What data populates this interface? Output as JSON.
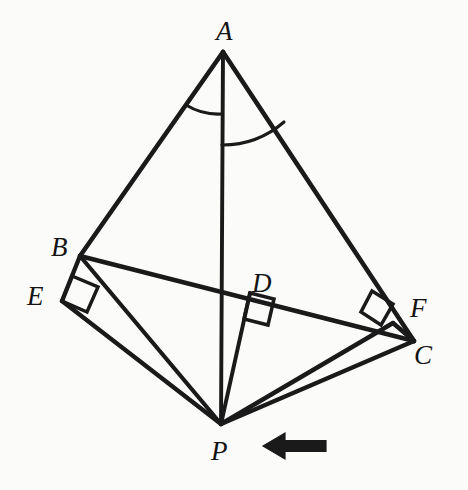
{
  "figure": {
    "background_color": "#fbfbf9",
    "stroke_color": "#1a1a1a",
    "label_color": "#131313",
    "canvas": {
      "width": 468,
      "height": 490
    },
    "points": [
      {
        "id": "A",
        "label": "A",
        "x": 223,
        "y": 52,
        "label_x": 225,
        "label_y": 31
      },
      {
        "id": "B",
        "label": "B",
        "x": 80,
        "y": 256,
        "label_x": 61,
        "label_y": 248
      },
      {
        "id": "C",
        "label": "C",
        "x": 414,
        "y": 341,
        "label_x": 424,
        "label_y": 356
      },
      {
        "id": "D",
        "label": "D",
        "x": 250,
        "y": 293,
        "label_x": 262,
        "label_y": 284
      },
      {
        "id": "E",
        "label": "E",
        "x": 62,
        "y": 301,
        "label_x": 37,
        "label_y": 297
      },
      {
        "id": "F",
        "label": "F",
        "x": 393,
        "y": 323,
        "label_x": 419,
        "label_y": 309
      },
      {
        "id": "P",
        "label": "P",
        "x": 221,
        "y": 424,
        "label_x": 219,
        "label_y": 452
      }
    ],
    "segments": [
      {
        "name": "side-AB",
        "from": "A",
        "to": "B"
      },
      {
        "name": "side-AC",
        "from": "A",
        "to": "C"
      },
      {
        "name": "side-BC",
        "from": "B",
        "to": "C"
      },
      {
        "name": "cevian-AP",
        "from": "A",
        "to": "P"
      },
      {
        "name": "segment-BE",
        "from": "B",
        "to": "E"
      },
      {
        "name": "segment-CF",
        "from": "C",
        "to": "F"
      },
      {
        "name": "perpendicular-PE",
        "from": "P",
        "to": "E"
      },
      {
        "name": "perpendicular-PF",
        "from": "P",
        "to": "F"
      },
      {
        "name": "perpendicular-PD",
        "from": "P",
        "to": "D"
      },
      {
        "name": "segment-PB",
        "from": "P",
        "to": "B"
      },
      {
        "name": "segment-PC",
        "from": "P",
        "to": "C"
      }
    ],
    "right_angle_marks": [
      {
        "name": "right-angle-at-E",
        "vertex": "E",
        "size": 26
      },
      {
        "name": "right-angle-at-F",
        "vertex": "F",
        "size": 24
      },
      {
        "name": "right-angle-at-D",
        "vertex": "D",
        "size": 25
      }
    ],
    "angle_arcs": [
      {
        "name": "angle-arc-BAP",
        "vertex": "A",
        "radius": 52,
        "note": "arc between AB and AP"
      },
      {
        "name": "angle-arc-PAC",
        "vertex": "A",
        "radius": 82,
        "note": "arc between AP and AC"
      }
    ],
    "annotations": [
      {
        "name": "pointer-arrow",
        "type": "arrow",
        "direction": "left",
        "tip_x": 263,
        "tail_x": 326,
        "y": 446,
        "shaft_height": 11,
        "head_width": 22,
        "head_height": 26,
        "color": "#1a1a1a"
      }
    ]
  }
}
